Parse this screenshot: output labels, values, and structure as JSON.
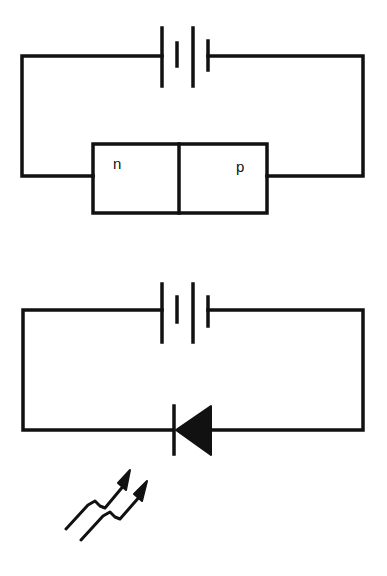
{
  "diagram": {
    "colors": {
      "stroke": "#111111",
      "background": "#ffffff"
    },
    "top_circuit": {
      "components": [
        "battery",
        "pn-junction"
      ],
      "junction_labels": {
        "n": "n",
        "p": "p"
      }
    },
    "bottom_circuit": {
      "components": [
        "battery",
        "diode"
      ],
      "emission_icon": "light-emission-arrows"
    }
  }
}
